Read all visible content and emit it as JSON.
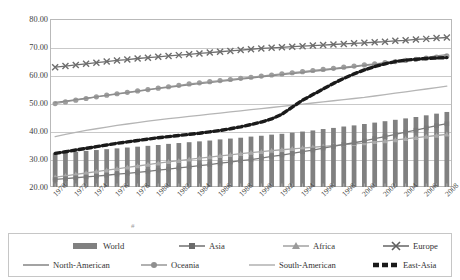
{
  "chart_data": {
    "type": "bar",
    "title": "",
    "subtitle": "",
    "xlabel": "",
    "ylabel": "",
    "ylim": [
      20,
      80
    ],
    "yticks": [
      20,
      30,
      40,
      50,
      60,
      70,
      80
    ],
    "ytick_labels": [
      "20.00",
      "30.00",
      "40.00",
      "50.00",
      "60.00",
      "70.00",
      "80.00"
    ],
    "grid": true,
    "legend_position": "bottom",
    "x": [
      1970,
      1971,
      1972,
      1973,
      1974,
      1975,
      1976,
      1977,
      1978,
      1979,
      1980,
      1981,
      1982,
      1983,
      1984,
      1985,
      1986,
      1987,
      1988,
      1989,
      1990,
      1991,
      1992,
      1993,
      1994,
      1995,
      1996,
      1997,
      1998,
      1999,
      2000,
      2001,
      2002,
      2003,
      2004,
      2005,
      2006,
      2007,
      2008
    ],
    "xtick_labels": [
      "1970",
      "1972",
      "1974",
      "1976",
      "1978",
      "1980",
      "1982",
      "1984",
      "1986",
      "1988",
      "1990",
      "1992",
      "1994",
      "1996",
      "1998",
      "2000",
      "2002",
      "2004",
      "2006",
      "2008"
    ],
    "categories": [
      "1970",
      "1971",
      "1972",
      "1973",
      "1974",
      "1975",
      "1976",
      "1977",
      "1978",
      "1979",
      "1980",
      "1981",
      "1982",
      "1983",
      "1984",
      "1985",
      "1986",
      "1987",
      "1988",
      "1989",
      "1990",
      "1991",
      "1992",
      "1993",
      "1994",
      "1995",
      "1996",
      "1997",
      "1998",
      "1999",
      "2000",
      "2001",
      "2002",
      "2003",
      "2004",
      "2005",
      "2006",
      "2007",
      "2008"
    ],
    "series": [
      {
        "name": "World",
        "type": "bar",
        "color": "#808080",
        "values": [
          32.0,
          32.3,
          32.6,
          32.9,
          33.2,
          33.5,
          33.8,
          34.1,
          34.4,
          34.7,
          35.0,
          35.4,
          35.7,
          36.0,
          36.3,
          36.6,
          37.0,
          37.3,
          37.6,
          38.0,
          38.3,
          38.7,
          39.0,
          39.4,
          39.8,
          40.2,
          40.7,
          41.1,
          41.6,
          42.0,
          42.5,
          43.0,
          43.5,
          44.0,
          44.5,
          45.0,
          45.6,
          46.2,
          46.8
        ]
      },
      {
        "name": "Asia",
        "type": "line",
        "marker": "square",
        "color": "#7a7a7a",
        "values": [
          22.7,
          23.0,
          23.3,
          23.6,
          23.9,
          24.2,
          24.6,
          24.9,
          25.2,
          25.6,
          26.0,
          26.4,
          26.8,
          27.2,
          27.6,
          28.0,
          28.5,
          28.9,
          29.4,
          29.8,
          30.3,
          30.9,
          31.4,
          32.0,
          32.6,
          33.2,
          33.9,
          34.5,
          35.2,
          35.8,
          36.5,
          37.3,
          38.0,
          38.8,
          39.6,
          40.3,
          41.1,
          41.9,
          42.6
        ]
      },
      {
        "name": "Africa",
        "type": "line",
        "marker": "triangle",
        "color": "#a8a8a8",
        "values": [
          23.5,
          24.0,
          24.5,
          25.0,
          25.5,
          26.0,
          26.5,
          27.0,
          27.5,
          28.0,
          28.5,
          29.0,
          29.4,
          29.9,
          30.3,
          30.7,
          31.1,
          31.5,
          31.9,
          32.3,
          32.6,
          33.0,
          33.3,
          33.6,
          33.9,
          34.2,
          34.5,
          34.8,
          35.1,
          35.4,
          35.7,
          36.1,
          36.4,
          36.8,
          37.2,
          37.6,
          38.0,
          38.4,
          38.8
        ]
      },
      {
        "name": "Europe",
        "type": "line",
        "marker": "cross",
        "color": "#6e6e6e",
        "values": [
          62.8,
          63.2,
          63.6,
          64.0,
          64.4,
          64.8,
          65.2,
          65.5,
          65.9,
          66.2,
          66.5,
          66.8,
          67.1,
          67.4,
          67.7,
          68.0,
          68.3,
          68.6,
          68.9,
          69.2,
          69.5,
          69.7,
          69.9,
          70.1,
          70.3,
          70.5,
          70.7,
          70.9,
          71.1,
          71.3,
          71.5,
          71.7,
          71.9,
          72.2,
          72.4,
          72.7,
          72.9,
          73.2,
          73.4
        ]
      },
      {
        "name": "North-American",
        "type": "line",
        "marker": "none",
        "color": "#8c8c8c",
        "values": [
          50.2,
          50.7,
          51.2,
          51.7,
          52.2,
          52.7,
          53.2,
          53.7,
          54.2,
          54.7,
          55.2,
          55.6,
          56.0,
          56.5,
          56.9,
          57.3,
          57.7,
          58.1,
          58.5,
          58.9,
          59.3,
          59.7,
          60.1,
          60.5,
          60.9,
          61.3,
          61.7,
          62.1,
          62.5,
          62.9,
          63.4,
          63.8,
          64.3,
          64.8,
          65.3,
          65.8,
          66.3,
          66.8,
          67.3
        ]
      },
      {
        "name": "Oceania",
        "type": "line",
        "marker": "circle",
        "color": "#9d9d9d",
        "values": [
          49.8,
          50.4,
          51.0,
          51.6,
          52.2,
          52.8,
          53.3,
          53.8,
          54.3,
          54.8,
          55.3,
          55.8,
          56.3,
          56.8,
          57.2,
          57.6,
          58.0,
          58.4,
          58.8,
          59.2,
          59.6,
          60.0,
          60.4,
          60.8,
          61.2,
          61.6,
          62.0,
          62.4,
          62.8,
          63.2,
          63.6,
          64.0,
          64.4,
          64.8,
          65.2,
          65.6,
          66.0,
          66.4,
          66.8
        ]
      },
      {
        "name": "South-American",
        "type": "line",
        "marker": "none",
        "color": "#b5b5b5",
        "values": [
          38.0,
          38.8,
          39.5,
          40.2,
          40.8,
          41.4,
          42.0,
          42.5,
          43.0,
          43.5,
          44.0,
          44.4,
          44.8,
          45.2,
          45.6,
          46.0,
          46.4,
          46.8,
          47.2,
          47.6,
          48.0,
          48.4,
          48.8,
          49.2,
          49.6,
          50.0,
          50.4,
          50.8,
          51.2,
          51.6,
          52.0,
          52.5,
          53.0,
          53.5,
          54.0,
          54.5,
          55.0,
          55.5,
          56.0
        ]
      },
      {
        "name": "East-Asia",
        "type": "line",
        "marker": "none",
        "style": "thick-dashed",
        "color": "#1a1a1a",
        "values": [
          32.0,
          32.6,
          33.2,
          33.8,
          34.4,
          35.0,
          35.6,
          36.1,
          36.6,
          37.1,
          37.6,
          38.0,
          38.4,
          38.8,
          39.2,
          39.7,
          40.2,
          40.8,
          41.5,
          42.3,
          43.2,
          44.3,
          46.0,
          48.5,
          51.0,
          53.0,
          55.0,
          57.0,
          58.8,
          60.4,
          61.8,
          63.0,
          64.0,
          64.8,
          65.3,
          65.6,
          65.9,
          66.1,
          66.2
        ]
      }
    ]
  },
  "axis": {
    "y_ticks": [
      {
        "label": "80.00",
        "value": 80
      },
      {
        "label": "70.00",
        "value": 70
      },
      {
        "label": "60.00",
        "value": 60
      },
      {
        "label": "50.00",
        "value": 50
      },
      {
        "label": "40.00",
        "value": 40
      },
      {
        "label": "30.00",
        "value": 30
      },
      {
        "label": "20.00",
        "value": 20
      }
    ],
    "x_ticks": [
      "1970",
      "1972",
      "1974",
      "1976",
      "1978",
      "1980",
      "1982",
      "1984",
      "1986",
      "1988",
      "1990",
      "1992",
      "1994",
      "1996",
      "1998",
      "2000",
      "2002",
      "2004",
      "2006",
      "2008"
    ]
  },
  "legend": {
    "row1": [
      {
        "label": "World",
        "key": "bar",
        "color": "#808080"
      },
      {
        "label": "Asia",
        "key": "line-square",
        "color": "#7a7a7a"
      },
      {
        "label": "Africa",
        "key": "line-triangle",
        "color": "#a8a8a8"
      },
      {
        "label": "Europe",
        "key": "line-cross",
        "color": "#6e6e6e"
      }
    ],
    "row2": [
      {
        "label": "North-American",
        "key": "line-plain",
        "color": "#8c8c8c"
      },
      {
        "label": "Oceania",
        "key": "line-circle",
        "color": "#9d9d9d"
      },
      {
        "label": "South-American",
        "key": "line-plain",
        "color": "#b5b5b5"
      },
      {
        "label": "East-Asia",
        "key": "line-thick",
        "color": "#1a1a1a"
      }
    ]
  },
  "colors": {
    "grid": "#c9c9c9",
    "frame": "#b9b9b9",
    "text": "#3a3a3a",
    "background": "#ffffff"
  },
  "stray": {
    "mark": "#"
  }
}
